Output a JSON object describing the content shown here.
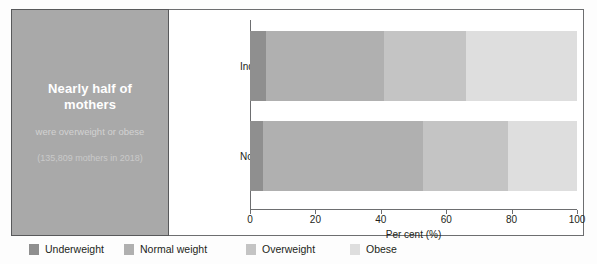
{
  "callout": {
    "headline": "Nearly half of mothers",
    "subtext": "were overweight or obese",
    "note": "(135,809 mothers in 2018)",
    "background_color": "#a9a9a9",
    "headline_color": "#ffffff"
  },
  "chart_data": {
    "type": "bar",
    "orientation": "horizontal",
    "stacked": true,
    "stack_total": 100,
    "title": "",
    "xlabel": "Per cent (%)",
    "ylabel": "",
    "xlim": [
      0,
      100
    ],
    "xticks": [
      "0",
      "20",
      "40",
      "60",
      "80",
      "100"
    ],
    "xtick_values": [
      0,
      20,
      40,
      60,
      80,
      100
    ],
    "grid": false,
    "legend_position": "bottom",
    "categories": [
      "Indigenous",
      "Non-Indigenous"
    ],
    "series": [
      {
        "name": "Underweight",
        "color": "#8f8f8f",
        "values": [
          5,
          4
        ]
      },
      {
        "name": "Normal weight",
        "color": "#b0b0b0",
        "values": [
          36,
          49
        ]
      },
      {
        "name": "Overweight",
        "color": "#c4c4c4",
        "values": [
          25,
          26
        ]
      },
      {
        "name": "Obese",
        "color": "#dedede",
        "values": [
          34,
          21
        ]
      }
    ]
  },
  "legend": {
    "items": [
      {
        "label": "Underweight",
        "color": "#8f8f8f"
      },
      {
        "label": "Normal weight",
        "color": "#b0b0b0"
      },
      {
        "label": "Overweight",
        "color": "#c4c4c4"
      },
      {
        "label": "Obese",
        "color": "#dedede"
      }
    ]
  }
}
